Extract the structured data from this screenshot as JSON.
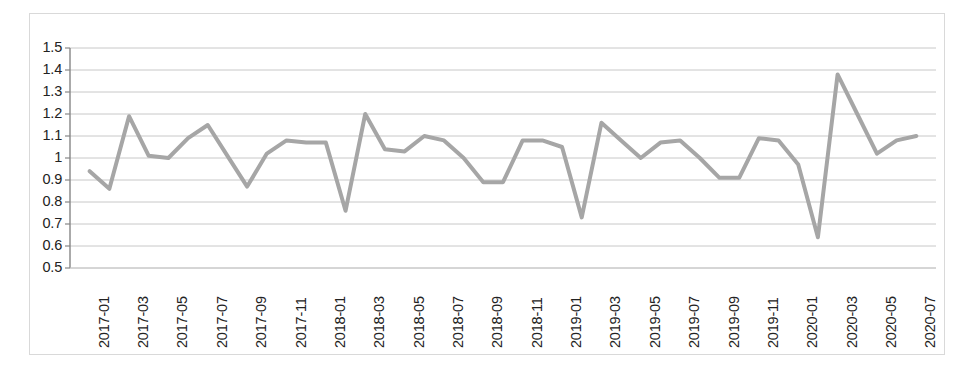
{
  "chart_data": {
    "type": "line",
    "title": "",
    "subtitle": "",
    "xlabel": "",
    "ylabel": "",
    "ylim": [
      0.5,
      1.5
    ],
    "y_ticks": [
      0.5,
      0.6,
      0.7,
      0.8,
      0.9,
      1.0,
      1.1,
      1.2,
      1.3,
      1.4,
      1.5
    ],
    "y_tick_labels": [
      "0.5",
      "0.6",
      "0.7",
      "0.8",
      "0.9",
      "1",
      "1.1",
      "1.2",
      "1.3",
      "1.4",
      "1.5"
    ],
    "grid": true,
    "grid_axis": "y",
    "legend": false,
    "legend_position": "none",
    "line_color": "#a6a6a6",
    "line_width": 4,
    "markers": false,
    "x": [
      "2017-01",
      "2017-02",
      "2017-03",
      "2017-04",
      "2017-05",
      "2017-06",
      "2017-07",
      "2017-08",
      "2017-09",
      "2017-10",
      "2017-11",
      "2017-12",
      "2018-01",
      "2018-02",
      "2018-03",
      "2018-04",
      "2018-05",
      "2018-06",
      "2018-07",
      "2018-08",
      "2018-09",
      "2018-10",
      "2018-11",
      "2018-12",
      "2019-01",
      "2019-02",
      "2019-03",
      "2019-04",
      "2019-05",
      "2019-06",
      "2019-07",
      "2019-08",
      "2019-09",
      "2019-10",
      "2019-11",
      "2019-12",
      "2020-01",
      "2020-02",
      "2020-03",
      "2020-04",
      "2020-05",
      "2020-06",
      "2020-07"
    ],
    "x_tick_labels": [
      "2017-01",
      "2017-03",
      "2017-05",
      "2017-07",
      "2017-09",
      "2017-11",
      "2018-01",
      "2018-03",
      "2018-05",
      "2018-07",
      "2018-09",
      "2018-11",
      "2019-01",
      "2019-03",
      "2019-05",
      "2019-07",
      "2019-09",
      "2019-11",
      "2020-01",
      "2020-03",
      "2020-05",
      "2020-07"
    ],
    "x_tick_step": 2,
    "values": [
      0.94,
      0.86,
      1.19,
      1.01,
      1.0,
      1.09,
      1.15,
      1.01,
      0.87,
      1.02,
      1.08,
      1.07,
      1.07,
      0.76,
      1.2,
      1.04,
      1.03,
      1.1,
      1.08,
      1.0,
      0.89,
      0.89,
      1.08,
      1.08,
      1.05,
      0.73,
      1.16,
      1.08,
      1.0,
      1.07,
      1.08,
      1.0,
      0.91,
      0.91,
      1.09,
      1.08,
      0.97,
      0.64,
      1.38,
      1.2,
      1.02,
      1.08,
      1.1
    ],
    "series": [
      {
        "name": "series-1",
        "color": "#a6a6a6",
        "values": [
          0.94,
          0.86,
          1.19,
          1.01,
          1.0,
          1.09,
          1.15,
          1.01,
          0.87,
          1.02,
          1.08,
          1.07,
          1.07,
          0.76,
          1.2,
          1.04,
          1.03,
          1.1,
          1.08,
          1.0,
          0.89,
          0.89,
          1.08,
          1.08,
          1.05,
          0.73,
          1.16,
          1.08,
          1.0,
          1.07,
          1.08,
          1.0,
          0.91,
          0.91,
          1.09,
          1.08,
          0.97,
          0.64,
          1.38,
          1.2,
          1.02,
          1.08,
          1.1
        ]
      }
    ],
    "annotations": []
  },
  "style": {
    "border_color": "#d9d9d9",
    "grid_color": "#c8c8c8",
    "axis_color": "#868686",
    "text_color": "#222222",
    "background": "#ffffff"
  }
}
